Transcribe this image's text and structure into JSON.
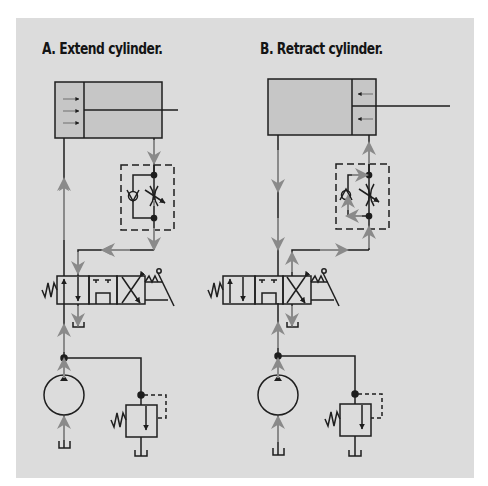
{
  "figure": {
    "background_color": "#ffffff",
    "panel_color": "#dcdcdc",
    "line_color": "#1e1e1e",
    "flow_arrow_color": "#8a8a8a",
    "cylinder_fill": "#c6c6c6",
    "diagrams": [
      {
        "id": "A",
        "title": "A. Extend cylinder.",
        "cylinder_state": "extending",
        "cylinder_arrows": "right",
        "components": [
          "double-acting cylinder",
          "flow control valve with check valve",
          "4-way 3-position directional valve (lever operated, spring return)",
          "hydraulic pump",
          "pressure relief valve",
          "reservoir"
        ]
      },
      {
        "id": "B",
        "title": "B. Retract cylinder.",
        "cylinder_state": "retracting",
        "cylinder_arrows": "left",
        "components": [
          "double-acting cylinder",
          "flow control valve with check valve",
          "4-way 3-position directional valve (lever operated, spring return)",
          "hydraulic pump",
          "pressure relief valve",
          "reservoir"
        ]
      }
    ]
  }
}
